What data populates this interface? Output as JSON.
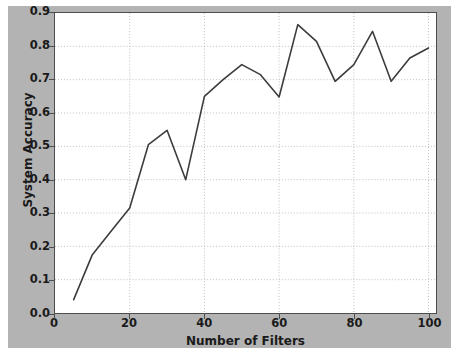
{
  "chart_data": {
    "type": "line",
    "title": "",
    "xlabel": "Number of Filters",
    "ylabel": "System Accuracy",
    "xlim": [
      0,
      102
    ],
    "ylim": [
      0.0,
      0.9
    ],
    "grid": true,
    "legend": null,
    "xticks": [
      "0",
      "20",
      "40",
      "60",
      "80",
      "100"
    ],
    "xtick_values": [
      0,
      20,
      40,
      60,
      80,
      100
    ],
    "yticks": [
      "0.0",
      "0.1",
      "0.2",
      "0.3",
      "0.4",
      "0.5",
      "0.6",
      "0.7",
      "0.8",
      "0.9"
    ],
    "ytick_values": [
      0.0,
      0.1,
      0.2,
      0.3,
      0.4,
      0.5,
      0.6,
      0.7,
      0.8,
      0.9
    ],
    "line_color": "#3c3c3c",
    "line_width": 1.6,
    "background_color": "#b3b3b3",
    "axes_color": "#ffffff",
    "series": [
      {
        "name": "System Accuracy",
        "x": [
          5,
          10,
          15,
          20,
          25,
          30,
          35,
          40,
          45,
          50,
          55,
          60,
          65,
          70,
          75,
          80,
          85,
          90,
          95,
          100
        ],
        "values": [
          0.04,
          0.175,
          0.245,
          0.315,
          0.505,
          0.548,
          0.4,
          0.65,
          0.7,
          0.745,
          0.715,
          0.648,
          0.865,
          0.815,
          0.695,
          0.745,
          0.845,
          0.695,
          0.765,
          0.795
        ]
      }
    ]
  }
}
